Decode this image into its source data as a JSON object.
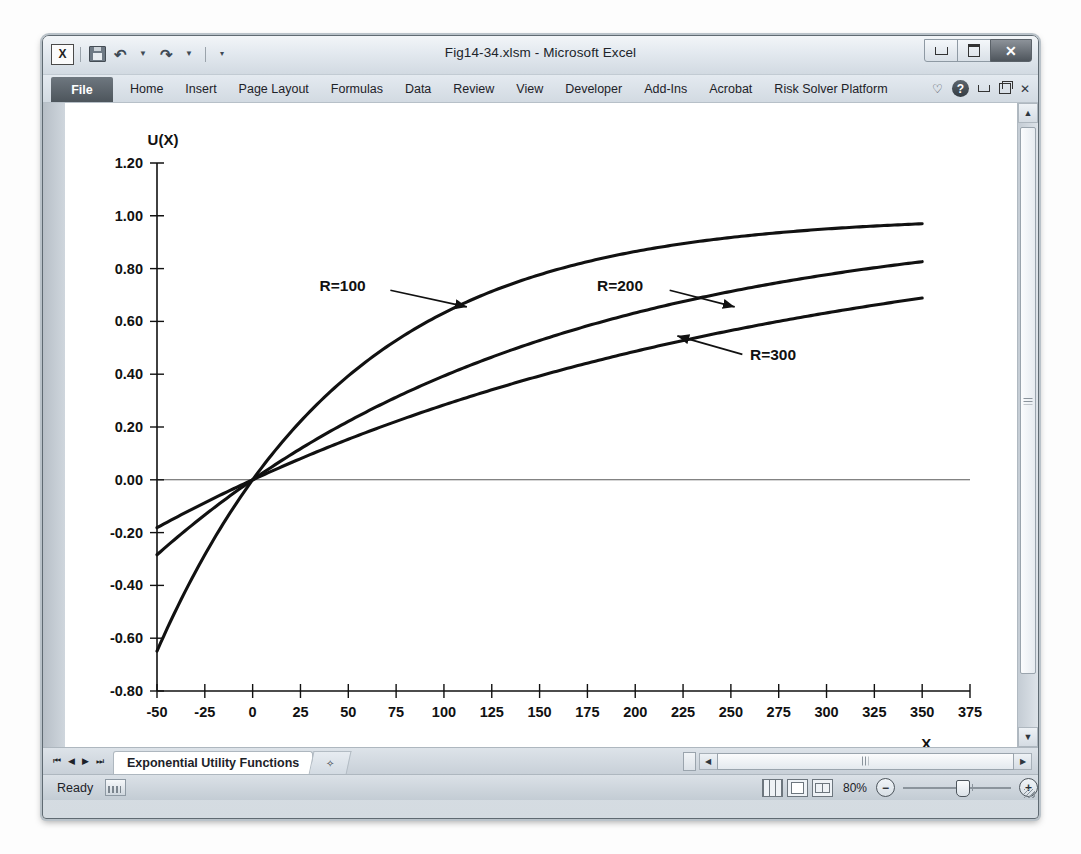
{
  "window": {
    "title": "Fig14-34.xlsm - Microsoft Excel",
    "minimize_label": "–",
    "maximize_label": "□",
    "close_label": "✕"
  },
  "quick_access": {
    "excel_icon": "X",
    "save_icon": "save-icon",
    "undo_icon": "↶",
    "redo_icon": "↷",
    "customize_icon": "▼"
  },
  "ribbon": {
    "file_label": "File",
    "tabs": [
      {
        "label": "Home"
      },
      {
        "label": "Insert"
      },
      {
        "label": "Page Layout"
      },
      {
        "label": "Formulas"
      },
      {
        "label": "Data"
      },
      {
        "label": "Review"
      },
      {
        "label": "View"
      },
      {
        "label": "Developer"
      },
      {
        "label": "Add-Ins"
      },
      {
        "label": "Acrobat"
      },
      {
        "label": "Risk Solver Platform"
      }
    ],
    "collapse_icon": "♡",
    "help_icon": "?",
    "minimize_ribbon_icon": "–",
    "restore_window_icon": "❐",
    "close_window_icon": "✕"
  },
  "sheet_tabs": {
    "first_icon": "⏮",
    "prev_icon": "◀",
    "next_icon": "▶",
    "last_icon": "⏭",
    "active_tab": "Exponential Utility Functions",
    "new_sheet_icon": "✧"
  },
  "scrollbars": {
    "v_up_icon": "▲",
    "v_down_icon": "▼",
    "h_left_icon": "◀",
    "h_right_icon": "▶"
  },
  "status_bar": {
    "state": "Ready",
    "macro_record_icon": "macro-record-icon",
    "view_normal_icon": "normal-view-icon",
    "view_page_layout_icon": "page-layout-view-icon",
    "view_page_break_icon": "page-break-view-icon",
    "zoom_level": "80%",
    "zoom_out_icon": "−",
    "zoom_in_icon": "+"
  },
  "chart_data": {
    "type": "line",
    "title": "",
    "xlabel": "X",
    "ylabel": "U(X)",
    "xlim": [
      -50,
      375
    ],
    "ylim": [
      -0.8,
      1.2
    ],
    "xticks": [
      -50,
      -25,
      0,
      25,
      50,
      75,
      100,
      125,
      150,
      175,
      200,
      225,
      250,
      275,
      300,
      325,
      350,
      375
    ],
    "yticks": [
      -0.8,
      -0.6,
      -0.4,
      -0.2,
      0.0,
      0.2,
      0.4,
      0.6,
      0.8,
      1.0,
      1.2
    ],
    "xtick_labels": [
      "-50",
      "-25",
      "0",
      "25",
      "50",
      "75",
      "100",
      "125",
      "150",
      "175",
      "200",
      "225",
      "250",
      "275",
      "300",
      "325",
      "350",
      "375"
    ],
    "ytick_labels": [
      "-0.80",
      "-0.60",
      "-0.40",
      "-0.20",
      "0.00",
      "0.20",
      "0.40",
      "0.60",
      "0.80",
      "1.00",
      "1.20"
    ],
    "grid": false,
    "legend": "annotations",
    "formula": "U(X) = a - b*exp(-X/R)",
    "x": [
      -50,
      -25,
      0,
      25,
      50,
      75,
      100,
      125,
      150,
      175,
      200,
      225,
      250,
      275,
      300,
      325,
      350
    ],
    "series": [
      {
        "name": "R=100",
        "R": 100,
        "values": [
          -0.6487,
          -0.284,
          0.0,
          0.2212,
          0.3935,
          0.5276,
          0.6321,
          0.7135,
          0.7769,
          0.8262,
          0.8647,
          0.8946,
          0.9179,
          0.9361,
          0.9502,
          0.9612,
          0.9698
        ],
        "annotation": {
          "label": "R=100",
          "arrow": "down-right"
        }
      },
      {
        "name": "R=200",
        "R": 200,
        "values": [
          -0.284,
          -0.1331,
          0.0,
          0.1175,
          0.2212,
          0.3127,
          0.3935,
          0.4647,
          0.5276,
          0.5831,
          0.6321,
          0.6753,
          0.7135,
          0.7471,
          0.7769,
          0.8032,
          0.8262
        ],
        "annotation": {
          "label": "R=200",
          "arrow": "down-right"
        }
      },
      {
        "name": "R=300",
        "R": 300,
        "values": [
          -0.1814,
          -0.087,
          0.0,
          0.08,
          0.1535,
          0.2212,
          0.2835,
          0.3408,
          0.3935,
          0.4421,
          0.4866,
          0.5276,
          0.5654,
          0.6001,
          0.6321,
          0.6615,
          0.6886
        ],
        "annotation": {
          "label": "R=300",
          "arrow": "up-left"
        }
      }
    ]
  }
}
